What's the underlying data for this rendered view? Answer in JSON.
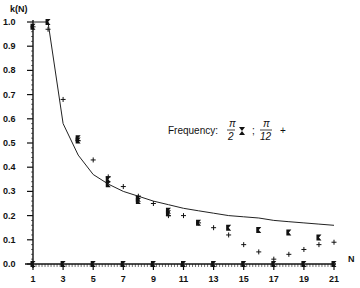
{
  "chart_data": {
    "type": "scatter",
    "title": "",
    "xlabel": "N",
    "ylabel": "k(N)",
    "xlim": [
      1,
      21
    ],
    "ylim": [
      0.0,
      1.0
    ],
    "x_ticks": [
      "1",
      "3",
      "5",
      "7",
      "9",
      "11",
      "13",
      "15",
      "17",
      "19",
      "21"
    ],
    "y_ticks": [
      "0.0",
      "0.1",
      "0.2",
      "0.3",
      "0.4",
      "0.5",
      "0.6",
      "0.7",
      "0.8",
      "0.9",
      "1.0"
    ],
    "grid": false,
    "legend": {
      "prefix": "Frequency:",
      "entries": [
        {
          "label_num": "π",
          "label_den": "2",
          "marker": "⧗"
        },
        {
          "label_num": "π",
          "label_den": "12",
          "marker": "+"
        }
      ],
      "separator": ";",
      "position": "center-right"
    },
    "series": [
      {
        "name": "Frequency π/2",
        "marker": "hourglass-cross",
        "points": [
          [
            1,
            0.0
          ],
          [
            1,
            0.98
          ],
          [
            2,
            1.0
          ],
          [
            3,
            0.0
          ],
          [
            4,
            0.52
          ],
          [
            4,
            0.51
          ],
          [
            5,
            0.0
          ],
          [
            6,
            0.35
          ],
          [
            6,
            0.33
          ],
          [
            7,
            0.0
          ],
          [
            8,
            0.27
          ],
          [
            8,
            0.26
          ],
          [
            9,
            0.0
          ],
          [
            10,
            0.22
          ],
          [
            10,
            0.21
          ],
          [
            11,
            0.0
          ],
          [
            12,
            0.17
          ],
          [
            13,
            0.0
          ],
          [
            14,
            0.15
          ],
          [
            15,
            0.0
          ],
          [
            16,
            0.14
          ],
          [
            17,
            0.0
          ],
          [
            18,
            0.13
          ],
          [
            19,
            0.0
          ],
          [
            20,
            0.11
          ],
          [
            21,
            0.0
          ]
        ]
      },
      {
        "name": "Frequency π/12",
        "marker": "plus",
        "points": [
          [
            1,
            0.98
          ],
          [
            2,
            0.97
          ],
          [
            3,
            0.68
          ],
          [
            4,
            0.51
          ],
          [
            5,
            0.43
          ],
          [
            6,
            0.36
          ],
          [
            7,
            0.32
          ],
          [
            8,
            0.28
          ],
          [
            9,
            0.25
          ],
          [
            10,
            0.2
          ],
          [
            11,
            0.2
          ],
          [
            12,
            0.17
          ],
          [
            13,
            0.15
          ],
          [
            14,
            0.12
          ],
          [
            15,
            0.08
          ],
          [
            16,
            0.05
          ],
          [
            17,
            0.02
          ],
          [
            18,
            0.04
          ],
          [
            19,
            0.06
          ],
          [
            20,
            0.08
          ],
          [
            21,
            0.09
          ]
        ]
      },
      {
        "name": "curve",
        "type": "line",
        "points": [
          [
            1,
            1.0
          ],
          [
            2,
            1.0
          ],
          [
            3,
            0.58
          ],
          [
            4,
            0.45
          ],
          [
            5,
            0.37
          ],
          [
            6,
            0.33
          ],
          [
            7,
            0.3
          ],
          [
            8,
            0.28
          ],
          [
            9,
            0.26
          ],
          [
            10,
            0.245
          ],
          [
            11,
            0.23
          ],
          [
            12,
            0.22
          ],
          [
            13,
            0.21
          ],
          [
            14,
            0.2
          ],
          [
            15,
            0.195
          ],
          [
            16,
            0.19
          ],
          [
            17,
            0.18
          ],
          [
            18,
            0.175
          ],
          [
            19,
            0.17
          ],
          [
            20,
            0.165
          ],
          [
            21,
            0.16
          ]
        ]
      }
    ]
  }
}
